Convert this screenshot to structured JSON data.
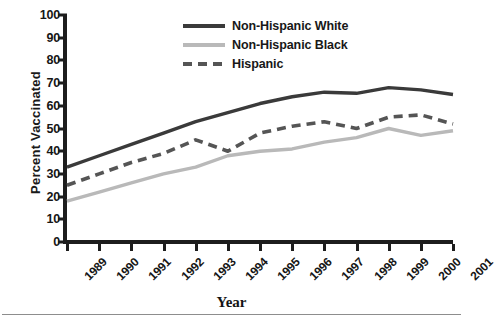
{
  "chart_data": {
    "type": "line",
    "title": "",
    "xlabel": "Year",
    "ylabel": "Percent Vaccinated",
    "grid": false,
    "legend_position": "top-center",
    "categories": [
      "1989",
      "1990",
      "1991",
      "1992",
      "1993",
      "1994",
      "1995",
      "1996",
      "1997",
      "1998",
      "1999",
      "2000",
      "2001"
    ],
    "x": [
      1989,
      1990,
      1991,
      1992,
      1993,
      1994,
      1995,
      1996,
      1997,
      1998,
      1999,
      2000,
      2001
    ],
    "xlim": [
      1989,
      2001
    ],
    "ylim": [
      0,
      100
    ],
    "yticks": [
      0,
      10,
      20,
      30,
      40,
      50,
      60,
      70,
      80,
      90,
      100
    ],
    "series": [
      {
        "name": "Non-Hispanic White",
        "color": "#3a3a3a",
        "style": "solid",
        "width": 3.4,
        "values": [
          33,
          38,
          43,
          48,
          53,
          57,
          61,
          64,
          66,
          65.5,
          68,
          67,
          65
        ]
      },
      {
        "name": "Non-Hispanic Black",
        "color": "#b9b9b9",
        "style": "solid",
        "width": 3.4,
        "values": [
          18,
          22,
          26,
          30,
          33,
          38,
          40,
          41,
          44,
          46,
          50,
          47,
          49
        ]
      },
      {
        "name": "Hispanic",
        "color": "#555555",
        "style": "dashed",
        "width": 3.6,
        "values": [
          25,
          30,
          35,
          39,
          45,
          40,
          48,
          51,
          53,
          50,
          55,
          56,
          52
        ]
      }
    ]
  },
  "axes": {
    "y_title": "Percent Vaccinated",
    "x_title": "Year",
    "y_tick_labels": [
      "100",
      "90",
      "80",
      "70",
      "60",
      "50",
      "40",
      "30",
      "20",
      "10",
      "0"
    ],
    "x_tick_labels": [
      "1989",
      "1990",
      "1991",
      "1992",
      "1993",
      "1994",
      "1995",
      "1996",
      "1997",
      "1998",
      "1999",
      "2000",
      "2001"
    ]
  },
  "legend": {
    "items": [
      {
        "label": "Non-Hispanic White",
        "color": "#3a3a3a",
        "style": "solid"
      },
      {
        "label": "Non-Hispanic Black",
        "color": "#b9b9b9",
        "style": "solid"
      },
      {
        "label": "Hispanic",
        "color": "#555555",
        "style": "dashed"
      }
    ]
  }
}
